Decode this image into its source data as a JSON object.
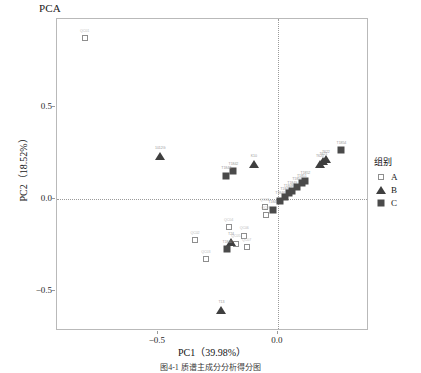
{
  "title": "PCA",
  "axes": {
    "xlabel": "PC1（39.98%）",
    "ylabel": "PC2（18.52%）",
    "x_ticks": [
      "-0.5",
      "0.0"
    ],
    "y_ticks": [
      "0.5",
      "0.0",
      "-0.5"
    ]
  },
  "legend": {
    "title": "组别",
    "items": [
      {
        "label": "A",
        "marker": "open-square",
        "color": "#8e8e8e"
      },
      {
        "label": "B",
        "marker": "filled-triangle",
        "color": "#3f3f3f"
      },
      {
        "label": "C",
        "marker": "filled-square",
        "color": "#4a4a4a"
      }
    ]
  },
  "caption": "图4-1  ­­­­质谱主成分分析得分图",
  "chart_data": {
    "type": "scatter",
    "title": "PCA",
    "xlabel": "PC1（39.98%）",
    "ylabel": "PC2（18.52%）",
    "xlim": [
      -0.92,
      0.38
    ],
    "ylim": [
      -0.72,
      0.98
    ],
    "grid": false,
    "reference_lines": {
      "x": 0.0,
      "y": 0.0
    },
    "legend_position": "right",
    "series": [
      {
        "name": "A",
        "marker": "open-square",
        "color": "#8e8e8e",
        "points": [
          {
            "label": "QC01",
            "x": -0.805,
            "y": 0.875
          },
          {
            "label": "QC02",
            "x": -0.345,
            "y": -0.225
          },
          {
            "label": "QC03",
            "x": -0.3,
            "y": -0.33
          },
          {
            "label": "QC04",
            "x": -0.205,
            "y": -0.155
          },
          {
            "label": "QC05",
            "x": -0.175,
            "y": -0.245
          },
          {
            "label": "QC06",
            "x": -0.14,
            "y": -0.2
          },
          {
            "label": "QC07",
            "x": -0.13,
            "y": -0.265
          },
          {
            "label": "QC08",
            "x": -0.055,
            "y": -0.045
          },
          {
            "label": "QC09",
            "x": -0.05,
            "y": -0.09
          }
        ]
      },
      {
        "name": "B",
        "marker": "filled-triangle",
        "color": "#3f3f3f",
        "points": [
          {
            "label": "1012G",
            "x": -0.49,
            "y": 0.235
          },
          {
            "label": "K10",
            "x": -0.1,
            "y": 0.19
          },
          {
            "label": "T13",
            "x": -0.235,
            "y": -0.605
          },
          {
            "label": "T620",
            "x": 0.175,
            "y": 0.19
          },
          {
            "label": "T621",
            "x": 0.19,
            "y": 0.205
          },
          {
            "label": "T622",
            "x": 0.2,
            "y": 0.215
          },
          {
            "label": "T24",
            "x": -0.195,
            "y": -0.235
          }
        ]
      },
      {
        "name": "C",
        "marker": "filled-square",
        "color": "#4a4a4a",
        "points": [
          {
            "label": "T1842",
            "x": -0.185,
            "y": 0.15
          },
          {
            "label": "T1843",
            "x": -0.215,
            "y": 0.125
          },
          {
            "label": "T1845",
            "x": -0.02,
            "y": -0.06
          },
          {
            "label": "T1846",
            "x": 0.01,
            "y": -0.01
          },
          {
            "label": "T1847",
            "x": 0.03,
            "y": 0.01
          },
          {
            "label": "T1848",
            "x": 0.045,
            "y": 0.03
          },
          {
            "label": "T1849",
            "x": 0.06,
            "y": 0.045
          },
          {
            "label": "T1850",
            "x": 0.08,
            "y": 0.065
          },
          {
            "label": "T1851",
            "x": 0.1,
            "y": 0.085
          },
          {
            "label": "T1852",
            "x": 0.115,
            "y": 0.1
          },
          {
            "label": "T1854",
            "x": 0.265,
            "y": 0.265
          },
          {
            "label": "T1840",
            "x": -0.21,
            "y": -0.275
          }
        ]
      }
    ]
  }
}
